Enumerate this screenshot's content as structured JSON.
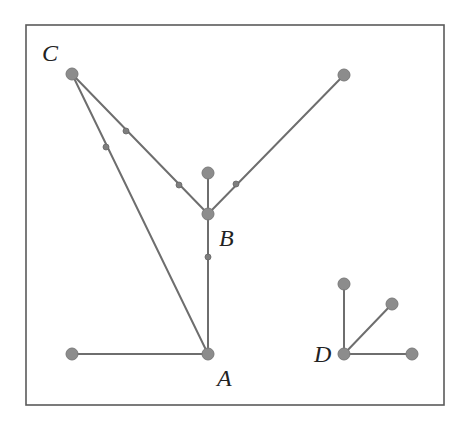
{
  "diagram": {
    "type": "graph",
    "frame": {
      "x": 26,
      "y": 25,
      "width": 418,
      "height": 380
    },
    "colors": {
      "node": "#8c8c8c",
      "edge": "#6e6e6e",
      "frame": "#5a5a5a",
      "label": "#222222"
    },
    "nodes": [
      {
        "id": "C",
        "x": 72,
        "y": 74,
        "label": "C",
        "label_x": 42,
        "label_y": 61
      },
      {
        "id": "TR",
        "x": 344,
        "y": 75,
        "label": ""
      },
      {
        "id": "BT",
        "x": 208,
        "y": 173,
        "label": ""
      },
      {
        "id": "B",
        "x": 208,
        "y": 214,
        "label": "B",
        "label_x": 219,
        "label_y": 246
      },
      {
        "id": "A",
        "x": 208,
        "y": 354,
        "label": "A",
        "label_x": 217,
        "label_y": 386
      },
      {
        "id": "L",
        "x": 72,
        "y": 354,
        "label": ""
      },
      {
        "id": "D",
        "x": 344,
        "y": 354,
        "label": "D",
        "label_x": 314,
        "label_y": 362
      },
      {
        "id": "DU",
        "x": 344,
        "y": 284,
        "label": ""
      },
      {
        "id": "DD",
        "x": 392,
        "y": 304,
        "label": ""
      },
      {
        "id": "DR",
        "x": 412,
        "y": 354,
        "label": ""
      }
    ],
    "edges": [
      {
        "from": "C",
        "to": "B",
        "midpoints": [
          [
            126,
            131
          ],
          [
            179,
            185
          ]
        ]
      },
      {
        "from": "C",
        "to": "A",
        "midpoints": [
          [
            106,
            147
          ]
        ]
      },
      {
        "from": "TR",
        "to": "B",
        "midpoints": [
          [
            236,
            184
          ]
        ]
      },
      {
        "from": "BT",
        "to": "B",
        "midpoints": []
      },
      {
        "from": "B",
        "to": "A",
        "midpoints": [
          [
            208,
            257
          ]
        ]
      },
      {
        "from": "L",
        "to": "A",
        "midpoints": []
      },
      {
        "from": "D",
        "to": "DU",
        "midpoints": []
      },
      {
        "from": "D",
        "to": "DD",
        "midpoints": []
      },
      {
        "from": "D",
        "to": "DR",
        "midpoints": []
      }
    ],
    "labels": {
      "A": "A",
      "B": "B",
      "C": "C",
      "D": "D"
    }
  }
}
